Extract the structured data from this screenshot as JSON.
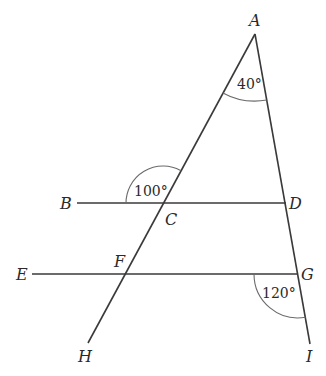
{
  "diagram": {
    "type": "geometry",
    "points": {
      "A": {
        "label": "A",
        "x": 255,
        "y": 34
      },
      "B": {
        "label": "B",
        "x": 77,
        "y": 203
      },
      "C": {
        "label": "C",
        "x": 163,
        "y": 203
      },
      "D": {
        "label": "D",
        "x": 286,
        "y": 203
      },
      "E": {
        "label": "E",
        "x": 32,
        "y": 274
      },
      "F": {
        "label": "F",
        "x": 124,
        "y": 274
      },
      "G": {
        "label": "G",
        "x": 298,
        "y": 274
      },
      "H": {
        "label": "H",
        "x": 88,
        "y": 343
      },
      "I": {
        "label": "I",
        "x": 310,
        "y": 344
      }
    },
    "segments": [
      {
        "from": "A",
        "to": "H"
      },
      {
        "from": "A",
        "to": "I"
      },
      {
        "from": "B",
        "to": "D"
      },
      {
        "from": "E",
        "to": "G"
      }
    ],
    "angles": [
      {
        "vertex": "A",
        "label": "40°"
      },
      {
        "vertex": "C",
        "label": "100°"
      },
      {
        "vertex": "G",
        "label": "120°"
      }
    ]
  }
}
